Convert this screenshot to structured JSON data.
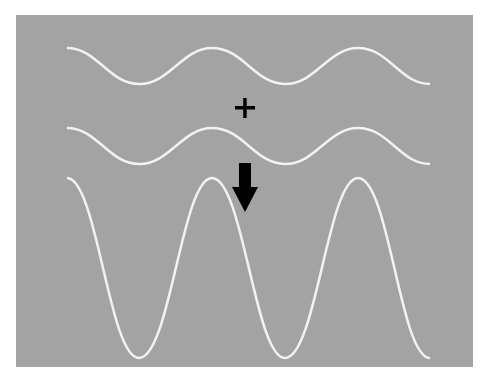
{
  "figure": {
    "background_color": "#a3a3a3",
    "wave_color": "#f2f2f2",
    "symbol_color": "#000000",
    "operator_symbol": "+",
    "result_symbol": "down-arrow",
    "waves": [
      {
        "name": "wave-1",
        "amplitude": 18,
        "center_y": 66,
        "periods": 2.5
      },
      {
        "name": "wave-2",
        "amplitude": 18,
        "center_y": 146,
        "periods": 2.5
      },
      {
        "name": "resultant-wave",
        "amplitude": 90,
        "center_y": 268,
        "periods": 2.5
      }
    ]
  }
}
